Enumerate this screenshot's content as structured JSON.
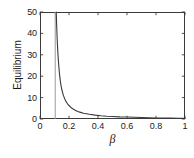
{
  "chart_data": {
    "type": "line",
    "title": "",
    "xlabel": "β",
    "ylabel": "Equilibrium",
    "xlim": [
      0,
      1
    ],
    "ylim": [
      0,
      50
    ],
    "grid": false,
    "legend": null,
    "xticks": [
      "0",
      "0.2",
      "0.4",
      "0.6",
      "0.8",
      "1"
    ],
    "xtick_values": [
      0,
      0.2,
      0.4,
      0.6,
      0.8,
      1
    ],
    "yticks": [
      "0",
      "10",
      "20",
      "30",
      "40",
      "50"
    ],
    "ytick_values": [
      0,
      10,
      20,
      30,
      40,
      50
    ],
    "asymptote": {
      "name": "threshold-asymptote",
      "x": 0.105,
      "color": "#9a9a9a",
      "orientation": "vertical"
    },
    "series": [
      {
        "name": "equilibrium",
        "color": "#3a3a3a",
        "x": [
          0.112,
          0.115,
          0.118,
          0.12,
          0.123,
          0.126,
          0.13,
          0.135,
          0.14,
          0.145,
          0.15,
          0.16,
          0.17,
          0.18,
          0.19,
          0.2,
          0.22,
          0.24,
          0.26,
          0.28,
          0.3,
          0.34,
          0.38,
          0.42,
          0.46,
          0.5,
          0.55,
          0.6,
          0.65,
          0.7,
          0.75,
          0.8,
          0.85,
          0.9,
          0.95,
          1.0
        ],
        "y": [
          50.0,
          43.5,
          38.2,
          35.1,
          31.2,
          28.0,
          24.4,
          20.6,
          17.8,
          15.6,
          13.9,
          11.3,
          9.5,
          8.1,
          7.1,
          6.3,
          5.0,
          4.2,
          3.5,
          3.1,
          2.7,
          2.2,
          1.8,
          1.5,
          1.3,
          1.2,
          1.0,
          0.9,
          0.8,
          0.7,
          0.6,
          0.5,
          0.45,
          0.4,
          0.36,
          0.32
        ]
      }
    ]
  },
  "axes": {
    "y_title": "Equilibrium",
    "x_title": "β"
  }
}
